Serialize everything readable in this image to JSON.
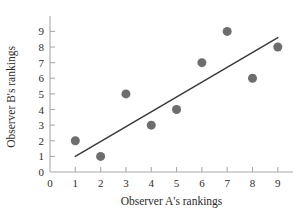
{
  "chart_data": {
    "type": "scatter",
    "title": "",
    "subtitle": "",
    "xlabel": "Observer A's rankings",
    "ylabel": "Observer B's rankings",
    "xlim": [
      0,
      9.6
    ],
    "ylim": [
      0,
      9.6
    ],
    "x_ticks": [
      0,
      1,
      2,
      3,
      4,
      5,
      6,
      7,
      8,
      9
    ],
    "y_ticks": [
      0,
      1,
      2,
      3,
      4,
      5,
      6,
      7,
      8,
      9
    ],
    "x_tick_labels": [
      "0",
      "1",
      "2",
      "3",
      "4",
      "5",
      "6",
      "7",
      "8",
      "9"
    ],
    "y_tick_labels": [
      "0",
      "1",
      "2",
      "3",
      "4",
      "5",
      "6",
      "7",
      "8",
      "9"
    ],
    "grid": false,
    "legend": null,
    "marker_color": "#6e6e6e",
    "marker_size": 9,
    "axis_color": "#aaaaaa",
    "text_color": "#2b2b2b",
    "x": [
      1,
      2,
      3,
      4,
      5,
      6,
      7,
      8,
      9
    ],
    "y": [
      2,
      1,
      5,
      3,
      4,
      7,
      9,
      6,
      8
    ],
    "points": [
      {
        "x": 1,
        "y": 2
      },
      {
        "x": 2,
        "y": 1
      },
      {
        "x": 3,
        "y": 5
      },
      {
        "x": 4,
        "y": 3
      },
      {
        "x": 5,
        "y": 4
      },
      {
        "x": 6,
        "y": 7
      },
      {
        "x": 7,
        "y": 9
      },
      {
        "x": 8,
        "y": 6
      },
      {
        "x": 9,
        "y": 8
      }
    ],
    "trend_line": {
      "type": "linear-fit",
      "color": "#3a3a3a",
      "x_start": 1,
      "y_start": 1.0,
      "x_end": 9,
      "y_end": 8.6
    }
  }
}
